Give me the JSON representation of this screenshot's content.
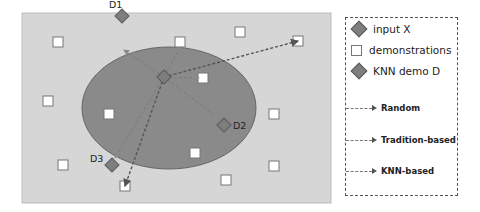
{
  "colors": {
    "background": "#d6d6d6",
    "ellipse_fill": "#8a8a8a",
    "ellipse_stroke": "#666666",
    "diamond_fill": "#7e7e7e",
    "diamond_stroke": "#5a5a5a",
    "square_fill": "#ffffff",
    "square_stroke": "#777777",
    "line": "#555555"
  },
  "diagram": {
    "panel": {
      "x": 22,
      "y": 13,
      "width": 309,
      "height": 190
    },
    "ellipse": {
      "cx": 169,
      "cy": 108,
      "rx": 87,
      "ry": 61
    },
    "input": {
      "label": "X",
      "x": 164,
      "y": 77
    },
    "knn_demos": [
      {
        "label": "D1",
        "x": 122,
        "y": 16
      },
      {
        "label": "D2",
        "x": 224,
        "y": 125
      },
      {
        "label": "D3",
        "x": 112,
        "y": 165
      }
    ],
    "demonstrations": [
      {
        "x": 58,
        "y": 42
      },
      {
        "x": 180,
        "y": 42
      },
      {
        "x": 240,
        "y": 32
      },
      {
        "x": 298,
        "y": 41
      },
      {
        "x": 203,
        "y": 78
      },
      {
        "x": 48,
        "y": 101
      },
      {
        "x": 109,
        "y": 114
      },
      {
        "x": 274,
        "y": 114
      },
      {
        "x": 195,
        "y": 153
      },
      {
        "x": 63,
        "y": 165
      },
      {
        "x": 274,
        "y": 166
      },
      {
        "x": 226,
        "y": 180
      },
      {
        "x": 125,
        "y": 186
      }
    ],
    "arrows": [
      {
        "type": "random",
        "from": [
          164,
          77
        ],
        "to": [
          298,
          41
        ]
      },
      {
        "type": "random",
        "from": [
          164,
          77
        ],
        "to": [
          125,
          186
        ]
      },
      {
        "type": "tradition",
        "from": [
          164,
          77
        ],
        "to": [
          199,
          78
        ]
      },
      {
        "type": "tradition",
        "from": [
          164,
          77
        ],
        "to": [
          180,
          47
        ]
      },
      {
        "type": "knn",
        "from": [
          164,
          77
        ],
        "to": [
          124,
          50
        ]
      },
      {
        "type": "knn",
        "from": [
          164,
          77
        ],
        "to": [
          218,
          118
        ]
      },
      {
        "type": "knn",
        "from": [
          164,
          77
        ],
        "to": [
          115,
          158
        ]
      }
    ]
  },
  "legend": {
    "input_label": "input  X",
    "demonstrations_label": "demonstrations",
    "knn_demo_label": "KNN demo  D",
    "random_label": "Random",
    "tradition_label": "Tradition-based",
    "knn_based_label": "KNN-based"
  }
}
